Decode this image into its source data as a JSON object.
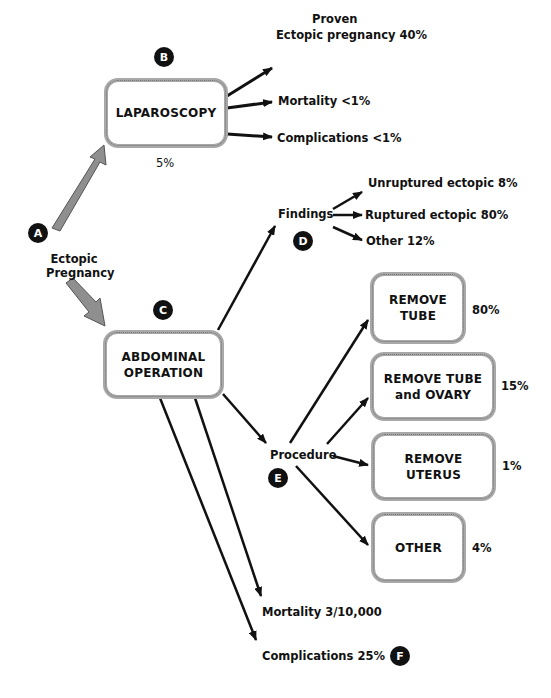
{
  "diagram": {
    "colors": {
      "text": "#111111",
      "box_border": "#a8a8a8",
      "main_arrow": "#8f8f8f",
      "badge": "#111111"
    },
    "badges": {
      "a": "A",
      "b": "B",
      "c": "C",
      "d": "D",
      "e": "E",
      "f": "F"
    },
    "start": {
      "line1": "Ectopic",
      "line2": "Pregnancy"
    },
    "laparoscopy": {
      "label": "LAPAROSCOPY",
      "percent": "5%",
      "outcomes": {
        "proven_line1": "Proven",
        "proven_line2": "Ectopic pregnancy  40%",
        "mortality": "Mortality <1%",
        "complications": "Complications <1%"
      }
    },
    "abdominal": {
      "label_line1": "ABDOMINAL",
      "label_line2": "OPERATION",
      "findings": {
        "label": "Findings",
        "items": [
          "Unruptured ectopic 8%",
          "Ruptured ectopic 80%",
          "Other 12%"
        ]
      },
      "procedure": {
        "label": "Procedure",
        "options": [
          {
            "line1": "REMOVE",
            "line2": "TUBE",
            "percent": "80%"
          },
          {
            "line1": "REMOVE TUBE",
            "line2": "and OVARY",
            "percent": "15%"
          },
          {
            "line1": "REMOVE UTERUS",
            "line2": "",
            "percent": "1%"
          },
          {
            "line1": "OTHER",
            "line2": "",
            "percent": "4%"
          }
        ]
      },
      "mortality": "Mortality 3/10,000",
      "complications": "Complications  25%"
    }
  }
}
